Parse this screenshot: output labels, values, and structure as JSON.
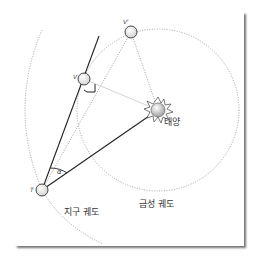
{
  "diagram": {
    "labels": {
      "sun": "태양",
      "earth_orbit": "지구 궤도",
      "venus_orbit": "금성 궤도",
      "earth": "T",
      "venus": "V",
      "venus_prime": "V'",
      "angle": "α"
    },
    "colors": {
      "line": "#222222",
      "dotted": "#8a8a8a",
      "light_line": "#c8c8c8",
      "planet_fill": "#f4f4f4",
      "sun_fill": "#d9d9d9"
    },
    "nodes": {
      "sun": {
        "x": 158,
        "y": 110
      },
      "earth": {
        "x": 42,
        "y": 190
      },
      "venus": {
        "x": 84,
        "y": 79
      },
      "venus_prime": {
        "x": 131,
        "y": 32
      }
    }
  }
}
